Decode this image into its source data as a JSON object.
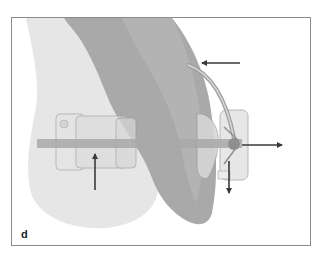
{
  "figure": {
    "panel_label": "d",
    "colors": {
      "background": "#ffffff",
      "border": "#8a8a8a",
      "tooth_light": "#e6e6e6",
      "tooth_dark": "#a9a9a9",
      "tooth_mid": "#b8b8b8",
      "archwire": "#b0b0b0",
      "bracket": "#d9d9d9",
      "bracket_outline": "#9a9a9a",
      "arrow": "#3a3a3a"
    },
    "arrows": [
      {
        "name": "force-arrow-up",
        "direction": "up"
      },
      {
        "name": "force-arrow-left",
        "direction": "left"
      },
      {
        "name": "force-arrow-right",
        "direction": "right"
      },
      {
        "name": "force-arrow-down",
        "direction": "down"
      }
    ]
  }
}
